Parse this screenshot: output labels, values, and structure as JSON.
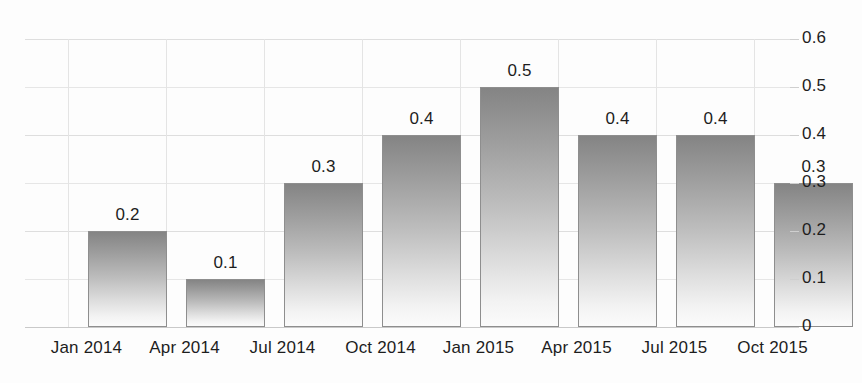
{
  "chart_data": {
    "type": "bar",
    "title": "",
    "subtitle": "",
    "xlabel": "",
    "ylabel": "",
    "categories": [
      "Jan 2014",
      "Apr 2014",
      "Jul 2014",
      "Oct 2014",
      "Jan 2015",
      "Apr 2015",
      "Jul 2015",
      "Oct 2015"
    ],
    "values": [
      0.2,
      0.1,
      0.3,
      0.4,
      0.5,
      0.4,
      0.3,
      0.3
    ],
    "value_labels": [
      "0.2",
      "0.1",
      "0.3",
      "0.4",
      "0.5",
      "0.4",
      "0.4",
      "0.3"
    ],
    "ylim": [
      0,
      0.6
    ],
    "ytick_labels": [
      "0",
      "0.1",
      "0.2",
      "0.3",
      "0.4",
      "0.5",
      "0.6"
    ],
    "ytick_values": [
      0,
      0.1,
      0.2,
      0.3,
      0.4,
      0.5,
      0.6
    ],
    "y_axis_position": "right",
    "grid": true,
    "grid_axes": "both",
    "legend": false,
    "legend_position": "none",
    "bar_fill": "vertical-gradient-gray",
    "bar_color_top": "#848484",
    "bar_color_bottom": "#fbfbfb",
    "bar_border_color": "#8e8e8e",
    "grid_color": "#dedede",
    "text_color": "#1d1d1d",
    "background_color": "#fdfdfd",
    "show_value_labels": true
  },
  "bars": [
    {
      "category": "Jan 2014",
      "label": "0.2",
      "value": 0.2
    },
    {
      "category": "Apr 2014",
      "label": "0.1",
      "value": 0.1
    },
    {
      "category": "Jul 2014",
      "label": "0.3",
      "value": 0.3
    },
    {
      "category": "Oct 2014",
      "label": "0.4",
      "value": 0.4
    },
    {
      "category": "Jan 2015",
      "label": "0.5",
      "value": 0.5
    },
    {
      "category": "Apr 2015",
      "label": "0.4",
      "value": 0.4
    },
    {
      "category": "Jul 2015",
      "label": "0.4",
      "value": 0.4
    },
    {
      "category": "Oct 2015",
      "label": "0.3",
      "value": 0.3
    }
  ],
  "y_axis": {
    "ticks": [
      {
        "label": "0.6",
        "value": 0.6
      },
      {
        "label": "0.5",
        "value": 0.5
      },
      {
        "label": "0.4",
        "value": 0.4
      },
      {
        "label": "0.3",
        "value": 0.3
      },
      {
        "label": "0.2",
        "value": 0.2
      },
      {
        "label": "0.1",
        "value": 0.1
      },
      {
        "label": "0",
        "value": 0
      }
    ]
  },
  "x_axis": {
    "ticks": [
      {
        "label": "Jan 2014"
      },
      {
        "label": "Apr 2014"
      },
      {
        "label": "Jul 2014"
      },
      {
        "label": "Oct 2014"
      },
      {
        "label": "Jan 2015"
      },
      {
        "label": "Apr 2015"
      },
      {
        "label": "Jul 2015"
      },
      {
        "label": "Oct 2015"
      }
    ]
  }
}
